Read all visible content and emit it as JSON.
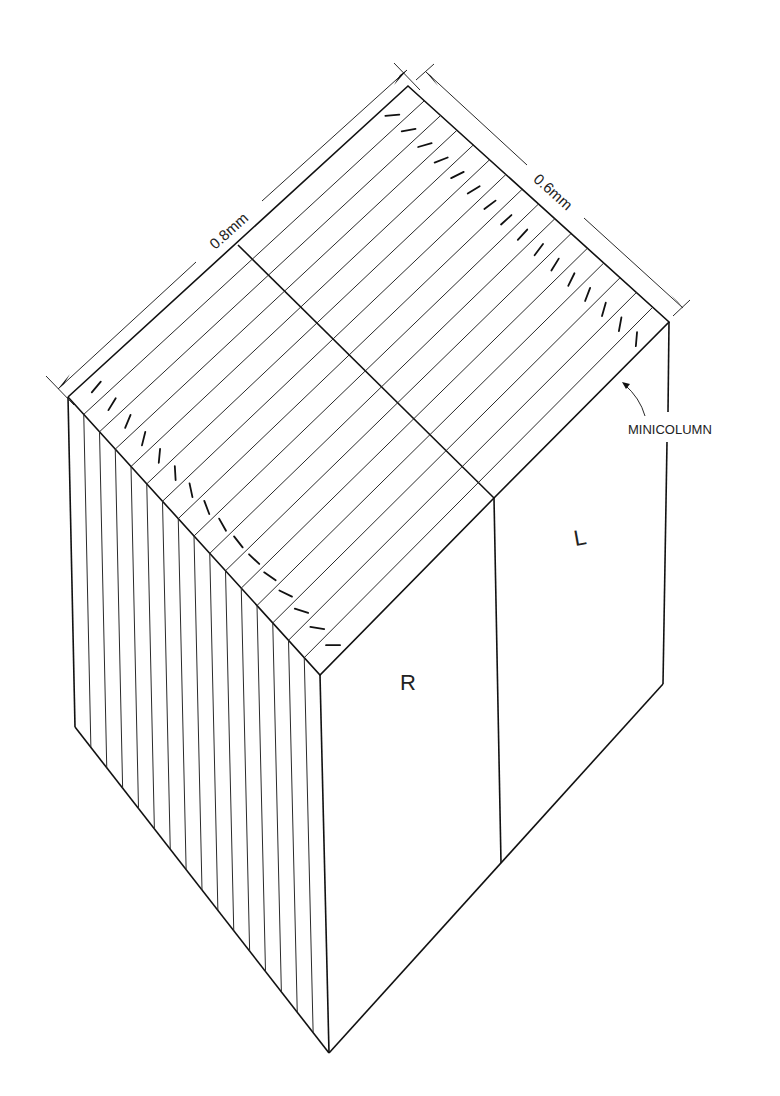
{
  "diagram": {
    "type": "isometric block model of cortical ocular dominance and orientation columns",
    "dimensions": {
      "length_label": "0.8mm",
      "width_label": "0.6mm"
    },
    "face_labels": {
      "right_eye": "R",
      "left_eye": "L"
    },
    "callout": {
      "label": "MINICOLUMN"
    },
    "strip_count": 16,
    "colors": {
      "line": "#1a1a1a",
      "background": "#ffffff"
    }
  }
}
